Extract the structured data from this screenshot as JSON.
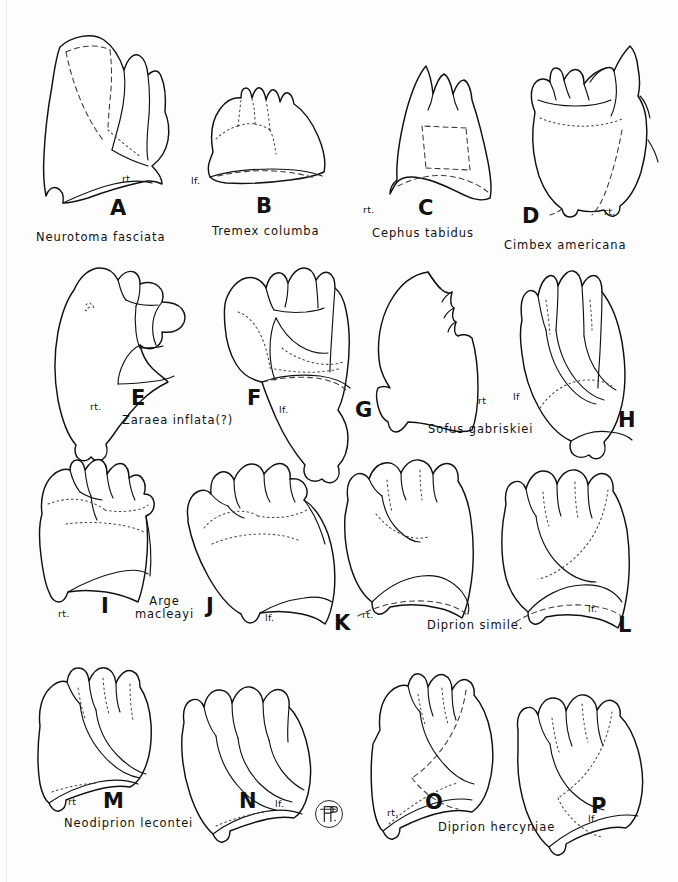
{
  "plate": {
    "background_color": "#fdfdfd",
    "ink_color": "#111111",
    "title": "",
    "monogram": "artist-monogram-AP"
  },
  "specimens": [
    {
      "letter": "A",
      "species": "Neurotoma fasciata",
      "side": "rt.",
      "row": 1,
      "column": 1
    },
    {
      "letter": "B",
      "species": "Tremex columba",
      "side": "lf.",
      "row": 1,
      "column": 2
    },
    {
      "letter": "C",
      "species": "Cephus tabidus",
      "side": "rt.",
      "row": 1,
      "column": 3
    },
    {
      "letter": "D",
      "species": "Cimbex americana",
      "side": "rt.",
      "row": 1,
      "column": 4
    },
    {
      "letter": "E",
      "species": "Zaraea inflata(?)",
      "side": "rt.",
      "row": 2,
      "column": 1
    },
    {
      "letter": "F",
      "species": "",
      "side": "lf.",
      "row": 2,
      "column": 2
    },
    {
      "letter": "G",
      "species": "Sofus gabriskiei",
      "side": "rt",
      "row": 2,
      "column": 3
    },
    {
      "letter": "H",
      "species": "",
      "side": "lf",
      "row": 2,
      "column": 4
    },
    {
      "letter": "I",
      "species": "Arge\nmacleayi",
      "side": "rt.",
      "row": 3,
      "column": 1
    },
    {
      "letter": "J",
      "species": "",
      "side": "lf.",
      "row": 3,
      "column": 2
    },
    {
      "letter": "K",
      "species": "Diprion simile.",
      "side": "rt.",
      "row": 3,
      "column": 3
    },
    {
      "letter": "L",
      "species": "",
      "side": "lf.",
      "row": 3,
      "column": 4
    },
    {
      "letter": "M",
      "species": "Neodiprion lecontei",
      "side": "rt",
      "row": 4,
      "column": 1
    },
    {
      "letter": "N",
      "species": "",
      "side": "lf.",
      "row": 4,
      "column": 2
    },
    {
      "letter": "O",
      "species": "Diprion hercyniae",
      "side": "rt.",
      "row": 4,
      "column": 3
    },
    {
      "letter": "P",
      "species": "",
      "side": "lf.",
      "row": 4,
      "column": 4
    }
  ]
}
